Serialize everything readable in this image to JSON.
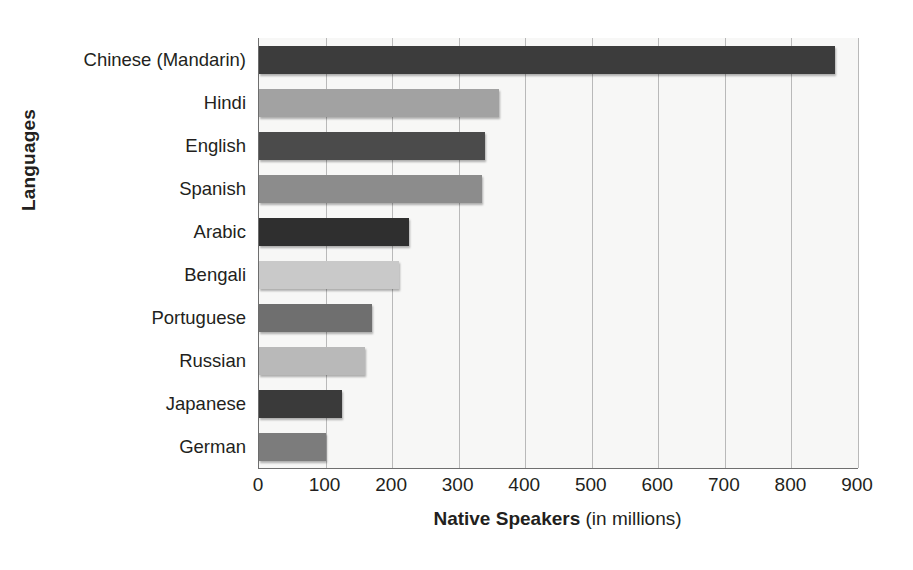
{
  "chart_data": {
    "type": "bar",
    "orientation": "horizontal",
    "title": "",
    "xlabel": "Native Speakers (in millions)",
    "xlabel_bold_part": "Native Speakers",
    "xlabel_light_part": "(in millions)",
    "ylabel": "Languages",
    "categories": [
      "Chinese (Mandarin)",
      "Hindi",
      "English",
      "Spanish",
      "Arabic",
      "Bengali",
      "Portuguese",
      "Russian",
      "Japanese",
      "German"
    ],
    "values": [
      865,
      360,
      340,
      335,
      225,
      210,
      170,
      160,
      125,
      100
    ],
    "bar_colors": [
      "#3c3c3c",
      "#a2a2a2",
      "#4b4b4b",
      "#8c8c8c",
      "#2f2f2f",
      "#c9c9c9",
      "#6f6f6f",
      "#b9b9b9",
      "#3a3a3a",
      "#7c7c7c"
    ],
    "xlim": [
      0,
      900
    ],
    "x_ticks": [
      0,
      100,
      200,
      300,
      400,
      500,
      600,
      700,
      800,
      900
    ],
    "x_tick_labels": [
      "0",
      "100",
      "200",
      "300",
      "400",
      "500",
      "600",
      "700",
      "800",
      "900"
    ],
    "grid": true,
    "grid_axis": "x",
    "legend": "none",
    "plot_background": "#f7f7f6",
    "axis_color": "#6f6f6f",
    "gridline_color": "#b9b9b9",
    "text_color": "#231f20"
  }
}
